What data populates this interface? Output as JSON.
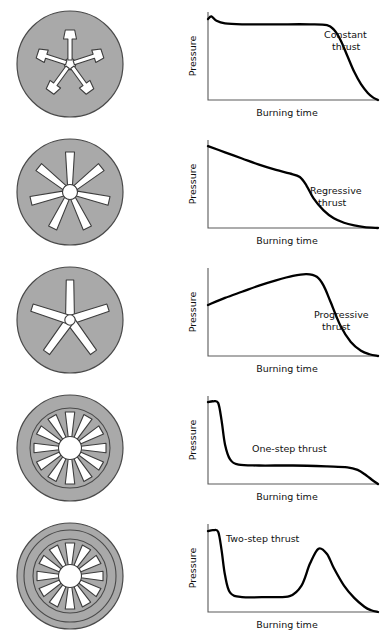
{
  "figure": {
    "background_color": "#ffffff",
    "grain_fill_color": "#a9a9a9",
    "grain_outline_color": "#4a4a4a",
    "port_fill_color": "#ffffff",
    "curve_color": "#000000",
    "axis_color": "#5a5a5a"
  },
  "axis_labels": {
    "x": "Burning time",
    "y": "Pressure"
  },
  "rows": [
    {
      "id": "constant",
      "grain": {
        "name": "five-point-dogbone-star-grain",
        "spokes": 5,
        "tip_shape": "dogbone",
        "rings": 1
      },
      "chart": {
        "label_lines": [
          "Constant",
          "thrust"
        ],
        "label_name": "constant-thrust-label"
      }
    },
    {
      "id": "regressive",
      "grain": {
        "name": "seven-spoke-radial-slot-grain",
        "spokes": 7,
        "tip_shape": "tapered",
        "rings": 1
      },
      "chart": {
        "label_lines": [
          "Regressive",
          "thrust"
        ],
        "label_name": "regressive-thrust-label"
      }
    },
    {
      "id": "progressive",
      "grain": {
        "name": "five-spoke-wide-star-grain",
        "spokes": 5,
        "tip_shape": "blunt",
        "rings": 1
      },
      "chart": {
        "label_lines": [
          "Progressive",
          "thrust"
        ],
        "label_name": "progressive-thrust-label"
      }
    },
    {
      "id": "one-step",
      "grain": {
        "name": "twelve-spoke-wagon-wheel-grain",
        "spokes": 12,
        "tip_shape": "tapered",
        "rings": 2
      },
      "chart": {
        "label_lines": [
          "One-step thrust"
        ],
        "label_name": "one-step-thrust-label"
      }
    },
    {
      "id": "two-step",
      "grain": {
        "name": "twelve-spoke-double-ring-wagon-wheel-grain",
        "spokes": 12,
        "tip_shape": "tapered",
        "rings": 3
      },
      "chart": {
        "label_lines": [
          "Two-step thrust"
        ],
        "label_name": "two-step-thrust-label"
      }
    }
  ],
  "chart_data": [
    {
      "type": "line",
      "title": "Constant thrust",
      "xlabel": "Burning time",
      "ylabel": "Pressure",
      "xlim": [
        0,
        1
      ],
      "ylim": [
        0,
        1
      ],
      "grid": false,
      "legend": "none",
      "annotations": [
        "Constant",
        "thrust"
      ],
      "x": [
        0.0,
        0.02,
        0.05,
        0.1,
        0.2,
        0.4,
        0.6,
        0.7,
        0.74,
        0.78,
        0.82,
        0.86,
        0.9,
        0.94,
        0.97,
        1.0
      ],
      "y": [
        0.92,
        0.95,
        0.9,
        0.87,
        0.86,
        0.86,
        0.86,
        0.85,
        0.8,
        0.68,
        0.5,
        0.32,
        0.18,
        0.08,
        0.03,
        0.0
      ]
    },
    {
      "type": "line",
      "title": "Regressive thrust",
      "xlabel": "Burning time",
      "ylabel": "Pressure",
      "xlim": [
        0,
        1
      ],
      "ylim": [
        0,
        1
      ],
      "grid": false,
      "legend": "none",
      "annotations": [
        "Regressive",
        "thrust"
      ],
      "x": [
        0.0,
        0.1,
        0.2,
        0.3,
        0.4,
        0.48,
        0.54,
        0.58,
        0.62,
        0.68,
        0.74,
        0.8,
        0.86,
        0.92,
        1.0
      ],
      "y": [
        0.93,
        0.86,
        0.79,
        0.72,
        0.66,
        0.62,
        0.58,
        0.48,
        0.34,
        0.2,
        0.11,
        0.06,
        0.03,
        0.01,
        0.0
      ]
    },
    {
      "type": "line",
      "title": "Progressive thrust",
      "xlabel": "Burning time",
      "ylabel": "Pressure",
      "xlim": [
        0,
        1
      ],
      "ylim": [
        0,
        1
      ],
      "grid": false,
      "legend": "none",
      "annotations": [
        "Progressive",
        "thrust"
      ],
      "x": [
        0.0,
        0.1,
        0.2,
        0.3,
        0.4,
        0.5,
        0.58,
        0.64,
        0.68,
        0.72,
        0.78,
        0.84,
        0.9,
        0.95,
        1.0
      ],
      "y": [
        0.58,
        0.66,
        0.73,
        0.8,
        0.86,
        0.91,
        0.93,
        0.9,
        0.8,
        0.62,
        0.34,
        0.16,
        0.06,
        0.02,
        0.0
      ]
    },
    {
      "type": "line",
      "title": "One-step thrust",
      "xlabel": "Burning time",
      "ylabel": "Pressure",
      "xlim": [
        0,
        1
      ],
      "ylim": [
        0,
        1
      ],
      "grid": false,
      "legend": "none",
      "annotations": [
        "One-step thrust"
      ],
      "x": [
        0.0,
        0.03,
        0.06,
        0.08,
        0.1,
        0.13,
        0.18,
        0.3,
        0.5,
        0.7,
        0.82,
        0.88,
        0.93,
        0.97,
        1.0
      ],
      "y": [
        0.93,
        0.94,
        0.92,
        0.72,
        0.45,
        0.28,
        0.22,
        0.21,
        0.21,
        0.2,
        0.19,
        0.16,
        0.1,
        0.04,
        0.0
      ]
    },
    {
      "type": "line",
      "title": "Two-step thrust",
      "xlabel": "Burning time",
      "ylabel": "Pressure",
      "xlim": [
        0,
        1
      ],
      "ylim": [
        0,
        1
      ],
      "grid": false,
      "legend": "none",
      "annotations": [
        "Two-step thrust"
      ],
      "x": [
        0.0,
        0.03,
        0.06,
        0.08,
        0.1,
        0.13,
        0.2,
        0.35,
        0.48,
        0.55,
        0.6,
        0.65,
        0.7,
        0.74,
        0.8,
        0.86,
        0.92,
        0.96,
        1.0
      ],
      "y": [
        0.92,
        0.93,
        0.91,
        0.7,
        0.42,
        0.22,
        0.17,
        0.17,
        0.18,
        0.3,
        0.55,
        0.72,
        0.66,
        0.5,
        0.3,
        0.16,
        0.06,
        0.02,
        0.0
      ]
    }
  ]
}
